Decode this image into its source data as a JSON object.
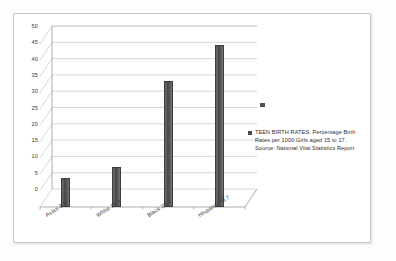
{
  "chart_data": {
    "type": "bar",
    "title": "",
    "categories": [
      "Asian 8.8",
      "White 12.4",
      "Black 38.7",
      "Hispanic 49.7"
    ],
    "category_names": [
      "Asian",
      "White",
      "Black",
      "Hispanic"
    ],
    "values": [
      8.8,
      12.4,
      38.7,
      49.7
    ],
    "series": [
      {
        "name": "TEEN BIRTH RATES: Percentage Birth Rates per 1000 Girls aged 15 to 17.  Source:  National Vital Statistics Report",
        "values": [
          8.8,
          12.4,
          38.7,
          49.7
        ]
      }
    ],
    "xlabel": "",
    "ylabel": "",
    "ylim": [
      0,
      50
    ],
    "yticks": [
      "0",
      "5",
      "10",
      "15",
      "20",
      "25",
      "30",
      "35",
      "40",
      "45",
      "50"
    ],
    "ytick_values": [
      0,
      5,
      10,
      15,
      20,
      25,
      30,
      35,
      40,
      45,
      50
    ],
    "grid": true,
    "legend_position": "right",
    "bar_color": "#4b4b4b",
    "grid_color": "#b9b9b9",
    "axis_color": "#9a9a9a"
  },
  "legend": {
    "marker": "legend-swatch",
    "text": "TEEN BIRTH RATES: Percentage Birth Rates per 1000 Girls aged 15 to 17.  Source:  National Vital Statistics Report"
  },
  "frame": {
    "border_color": "#c9c9c9",
    "background": "#ffffff"
  }
}
